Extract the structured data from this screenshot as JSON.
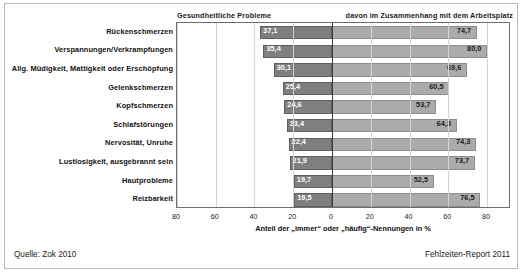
{
  "headers": {
    "left": "Gesundheitliche Probleme",
    "right": "davon im Zusammenhang mit dem Arbeitsplatz"
  },
  "footer": {
    "source": "Quelle: Zok 2010",
    "report": "Fehlzeiten-Report 2011"
  },
  "colors": {
    "bar_left": "#7f7f7f",
    "bar_right": "#ababab",
    "axis": "#3a3a3a",
    "grid": "#d4d4d4",
    "frame": "#6e6e6e"
  },
  "chart_data": {
    "type": "bar",
    "orientation": "horizontal-diverging",
    "title": "",
    "xlabel": "Anteil der „immer“ oder „häufig“-Nennungen in %",
    "ylabel": "",
    "grid": true,
    "legend_position": "top",
    "axis_ticks_left": [
      "80",
      "60",
      "40",
      "20"
    ],
    "axis_ticks_right": [
      "0",
      "20",
      "40",
      "60",
      "80"
    ],
    "tick_values_left": [
      80,
      60,
      40,
      20
    ],
    "tick_values_right": [
      0,
      20,
      40,
      60,
      80
    ],
    "xlim_left": [
      0,
      85
    ],
    "xlim_right": [
      0,
      92
    ],
    "categories": [
      "Rückenschmerzen",
      "Verspannungen/Verkrampfungen",
      "Allg. Müdigkeit, Mattigkeit oder Erschöpfung",
      "Gelenkschmerzen",
      "Kopfschmerzen",
      "Schlafstörungen",
      "Nervosität, Unruhe",
      "Lustlosigkeit, ausgebrannt sein",
      "Hautprobleme",
      "Reizbarkeit"
    ],
    "series": [
      {
        "name": "Gesundheitliche Probleme",
        "values": [
          37.1,
          35.4,
          30.1,
          25.4,
          24.6,
          23.4,
          22.4,
          21.9,
          19.7,
          19.5
        ],
        "labels": [
          "37,1",
          "35,4",
          "30,1",
          "25,4",
          "24,6",
          "23,4",
          "22,4",
          "21,9",
          "19,7",
          "19,5"
        ]
      },
      {
        "name": "davon im Zusammenhang mit dem Arbeitsplatz",
        "values": [
          74.7,
          80.0,
          69.6,
          60.5,
          53.7,
          64.3,
          74.3,
          73.7,
          52.5,
          76.5
        ],
        "labels": [
          "74,7",
          "80,0",
          "69,6",
          "60,5",
          "53,7",
          "64,3",
          "74,3",
          "73,7",
          "52,5",
          "76,5"
        ]
      }
    ]
  }
}
